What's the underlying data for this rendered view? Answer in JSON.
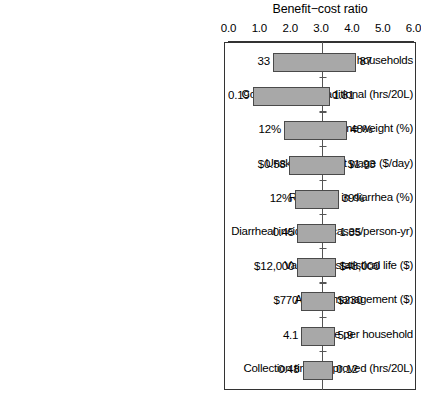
{
  "chart_data": {
    "type": "bar",
    "subtype": "tornado",
    "title": "Benefit−cost ratio",
    "xlabel": "Benefit−cost ratio",
    "ylabel": "",
    "xlim": [
      0.0,
      6.0
    ],
    "xticks": [
      0.0,
      1.0,
      2.0,
      3.0,
      4.0,
      5.0,
      6.0
    ],
    "xtick_labels": [
      "0.0",
      "1.0",
      "2.0",
      "3.0",
      "4.0",
      "5.0",
      "6.0"
    ],
    "baseline": 3.05,
    "grid": false,
    "legend": null,
    "bar_fill_color": "#a8a8a8",
    "bar_edge_color": "#4a4a4a",
    "frame_color": "#333333",
    "categories": [
      "# households",
      "Collection time: traditional (hrs/20L)",
      "Value of time weight (%)",
      "Unskilled market wage ($/day)",
      "Reduction in diarrhea (%)",
      "Diarrheal incidence (cases/person-yr)",
      "Value of a statistical life ($)",
      "Annual management ($)",
      "People per household",
      "Collection time: improved (hrs/20L)"
    ],
    "rows": [
      {
        "label": "# households",
        "low_label": "33",
        "high_label": "87",
        "bar_start": 1.44,
        "bar_end": 4.15
      },
      {
        "label": "Collection time: traditional (hrs/20L)",
        "low_label": "0.19",
        "high_label": "1.81",
        "bar_start": 0.78,
        "bar_end": 3.28
      },
      {
        "label": "Value of time weight (%)",
        "low_label": "12%",
        "high_label": "48%",
        "bar_start": 1.8,
        "bar_end": 3.85
      },
      {
        "label": "Unskilled market wage ($/day)",
        "low_label": "$0.58",
        "high_label": "$1.93",
        "bar_start": 1.95,
        "bar_end": 3.77
      },
      {
        "label": "Reduction in diarrhea (%)",
        "low_label": "12%",
        "high_label": "39%",
        "bar_start": 2.16,
        "bar_end": 3.58
      },
      {
        "label": "Diarrheal incidence (cases/person-yr)",
        "low_label": "0.45",
        "high_label": "1.35",
        "bar_start": 2.23,
        "bar_end": 3.5
      },
      {
        "label": "Value of a statistical life ($)",
        "low_label": "$12,000",
        "high_label": "$48,000",
        "bar_start": 2.23,
        "bar_end": 3.5
      },
      {
        "label": "Annual management ($)",
        "low_label": "$770",
        "high_label": "$230",
        "bar_start": 2.36,
        "bar_end": 3.44
      },
      {
        "label": "People per household",
        "low_label": "4.1",
        "high_label": "5.9",
        "bar_start": 2.36,
        "bar_end": 3.44
      },
      {
        "label": "Collection time: improved (hrs/20L)",
        "low_label": "0.48",
        "high_label": "0.12",
        "bar_start": 2.4,
        "bar_end": 3.4
      }
    ]
  }
}
